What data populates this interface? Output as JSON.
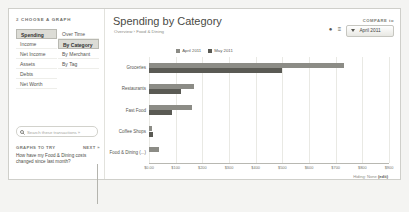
{
  "sidebar": {
    "heading_num": "2",
    "heading": "CHOOSE A GRAPH",
    "graph_types": [
      {
        "label": "Spending",
        "selected": true
      },
      {
        "label": "Income",
        "selected": false
      },
      {
        "label": "Net Income",
        "selected": false
      },
      {
        "label": "Assets",
        "selected": false
      },
      {
        "label": "Debts",
        "selected": false
      },
      {
        "label": "Net Worth",
        "selected": false
      }
    ],
    "breakdowns": [
      {
        "label": "Over Time",
        "selected": false
      },
      {
        "label": "By Category",
        "selected": true
      },
      {
        "label": "By Merchant",
        "selected": false
      },
      {
        "label": "By Tag",
        "selected": false
      }
    ],
    "search": {
      "icon": "search-icon",
      "placeholder": "Search these transactions »",
      "value": ""
    },
    "tips": {
      "header": "GRAPHS TO TRY",
      "next": "NEXT »",
      "question": "How have my Food & Dining costs changed since last month?"
    }
  },
  "header": {
    "title": "Spending by Category",
    "breadcrumb": "Overview  ›  Food & Dining",
    "icons": [
      "print-icon",
      "export-icon"
    ],
    "compare": {
      "label": "COMPARE to",
      "selected": "April 2011",
      "caret": "chevron-down-icon"
    }
  },
  "legend": {
    "items": [
      {
        "label": "April 2011",
        "color": "#8c8c86"
      },
      {
        "label": "May 2011",
        "color": "#5a5a54"
      }
    ]
  },
  "footer": {
    "hiding_label": "Hiding: None",
    "hiding_edit": "(edit)"
  },
  "chart_data": {
    "type": "bar",
    "orientation": "horizontal",
    "title": "Spending by Category",
    "xlabel": "",
    "ylabel": "",
    "grid": true,
    "legend_position": "top-center",
    "xlim": [
      0,
      900
    ],
    "xticks": [
      "$0.00",
      "$100",
      "$200",
      "$300",
      "$400",
      "$500",
      "$600",
      "$700",
      "$800",
      "$900"
    ],
    "xtick_values": [
      0,
      100,
      200,
      300,
      400,
      500,
      600,
      700,
      800,
      900
    ],
    "categories": [
      "Groceries",
      "Restaurants",
      "Fast Food",
      "Coffee Shops",
      "Food & Dining (...)"
    ],
    "series": [
      {
        "name": "April 2011",
        "color": "#8c8c86",
        "values": [
          730,
          168,
          160,
          12,
          38
        ]
      },
      {
        "name": "May 2011",
        "color": "#5a5a54",
        "values": [
          500,
          120,
          88,
          16,
          0
        ]
      }
    ]
  }
}
